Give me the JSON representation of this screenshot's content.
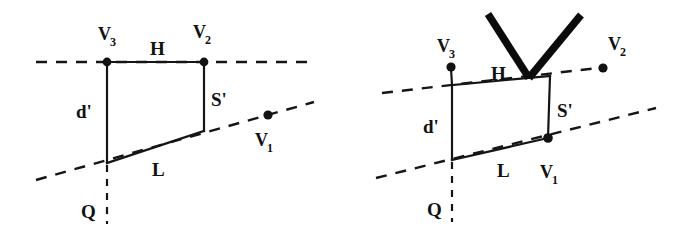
{
  "figure": {
    "background_color": "#ffffff",
    "ink_color": "#121212",
    "panels": [
      {
        "id": "left-panel",
        "name": "left-diagram",
        "labels": {
          "v3": "V",
          "v3_sub": "3",
          "v2": "V",
          "v2_sub": "2",
          "v1": "V",
          "v1_sub": "1",
          "h": "H",
          "s_prime": "S'",
          "d_prime": "d'",
          "l": "L",
          "q": "Q"
        },
        "geometry": {
          "quad_top_left": [
            107,
            62
          ],
          "quad_top_right": [
            204,
            62
          ],
          "quad_bottom_right": [
            204,
            131
          ],
          "quad_bottom_left": [
            107,
            163
          ],
          "v1_dot": [
            268,
            115
          ],
          "upper_dashed": [
            [
              36,
              62
            ],
            [
              308,
              62
            ]
          ],
          "lower_dashed": [
            [
              36,
              180
            ],
            [
              314,
              102
            ]
          ],
          "vertical_dashed": [
            [
              107,
              163
            ],
            [
              107,
              224
            ]
          ]
        },
        "has_arrow": false
      },
      {
        "id": "right-panel",
        "name": "right-diagram",
        "labels": {
          "v3": "V",
          "v3_sub": "3",
          "v2": "V",
          "v2_sub": "2",
          "v1": "V",
          "v1_sub": "1",
          "h": "H",
          "s_prime": "S'",
          "d_prime": "d'",
          "l": "L",
          "q": "Q"
        },
        "geometry": {
          "quad_top_left": [
            452,
            85
          ],
          "quad_top_right": [
            550,
            76
          ],
          "quad_bottom_right": [
            548,
            138
          ],
          "quad_bottom_left": [
            452,
            160
          ],
          "v3_dot": [
            451,
            68
          ],
          "v2_dot": [
            603,
            68
          ],
          "v1_dot": [
            548,
            138
          ],
          "upper_dashed": [
            [
              382,
              92
            ],
            [
              598,
              68
            ]
          ],
          "lower_dashed": [
            [
              376,
              178
            ],
            [
              655,
              108
            ]
          ],
          "vertical_dashed": [
            [
              452,
              160
            ],
            [
              452,
              222
            ]
          ],
          "arrow_apex": [
            529,
            77
          ],
          "arrow_left_tip": [
            488,
            14
          ],
          "arrow_right_tip": [
            581,
            15
          ]
        },
        "has_arrow": true
      }
    ]
  }
}
